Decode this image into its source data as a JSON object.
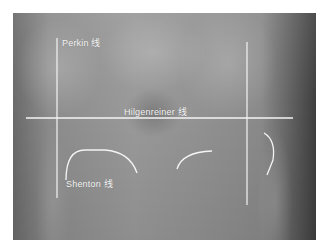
{
  "figure": {
    "annotation_color": "#f4f4f4",
    "labels": {
      "perkin": "Perkin 线",
      "hilgenreiner": "Hilgenreiner 线",
      "shenton": "Shenton 线"
    },
    "lines": {
      "hilgenreiner": {
        "x1": 26,
        "y1": 118,
        "x2": 293,
        "y2": 118
      },
      "perkin_left": {
        "x1": 57,
        "y1": 38,
        "x2": 57,
        "y2": 198
      },
      "perkin_right": {
        "x1": 247,
        "y1": 42,
        "x2": 247,
        "y2": 205
      }
    }
  }
}
